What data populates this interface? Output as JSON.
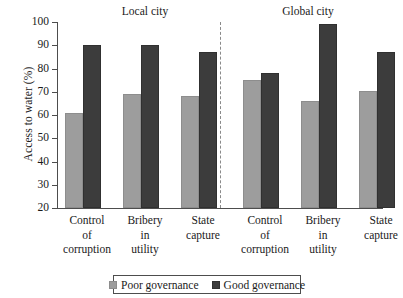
{
  "chart_data": {
    "type": "bar",
    "title": "",
    "xlabel": "",
    "ylabel": "Access to water (%)",
    "ylim": [
      20,
      100
    ],
    "yticks": [
      20,
      30,
      40,
      50,
      60,
      70,
      80,
      90,
      100
    ],
    "grid": false,
    "legend_position": "bottom",
    "panels": [
      {
        "name": "Local city",
        "categories": [
          "Control of corruption",
          "Bribery in utility",
          "State capture"
        ]
      },
      {
        "name": "Global city",
        "categories": [
          "Control of corruption",
          "Bribery in utility",
          "State capture"
        ]
      }
    ],
    "categories": [
      "Control of corruption",
      "Bribery in utility",
      "State capture",
      "Control of corruption",
      "Bribery in utility",
      "State capture"
    ],
    "series": [
      {
        "name": "Poor governance",
        "color": "#9d9d9d",
        "values": [
          61,
          69,
          68,
          75,
          66,
          70.5
        ]
      },
      {
        "name": "Good governance",
        "color": "#3c3c3c",
        "values": [
          90,
          90,
          87,
          78,
          99,
          87
        ]
      }
    ]
  },
  "axis": {
    "y_title": "Access to water (%)",
    "tick_labels": [
      "100",
      "90",
      "80",
      "70",
      "60",
      "50",
      "40",
      "30",
      "20"
    ]
  },
  "panel_titles": {
    "local": "Local city",
    "global": "Global city"
  },
  "x_labels": [
    {
      "l1": "Control",
      "l2": "of",
      "l3": "corruption"
    },
    {
      "l1": "Bribery",
      "l2": "in",
      "l3": "utility"
    },
    {
      "l1": "State",
      "l2": "capture",
      "l3": ""
    },
    {
      "l1": "Control",
      "l2": "of",
      "l3": "corruption"
    },
    {
      "l1": "Bribery",
      "l2": "in",
      "l3": "utility"
    },
    {
      "l1": "State",
      "l2": "capture",
      "l3": ""
    }
  ],
  "legend": {
    "items": [
      {
        "label": "Poor governance",
        "color": "#9d9d9d"
      },
      {
        "label": "Good governance",
        "color": "#3c3c3c"
      }
    ]
  }
}
